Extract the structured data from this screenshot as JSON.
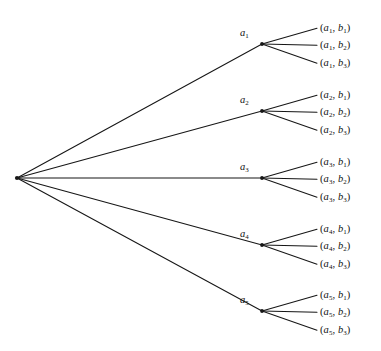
{
  "figure": {
    "kind": "tree-diagram",
    "title": "",
    "background_color": "#ffffff",
    "line_color": "#161616",
    "text_color": "#111111"
  },
  "root": {
    "label": "",
    "x": 17,
    "y": 178
  },
  "branches": [
    {
      "id": "a1",
      "label_main": "a",
      "label_sub": "1",
      "node_x": 262,
      "node_y": 44,
      "label_x": 240,
      "label_y": 28,
      "leaves": [
        {
          "open": "(",
          "first_main": "a",
          "first_sub": "1",
          "comma": ", ",
          "second_main": "b",
          "second_sub": "1",
          "close": ")",
          "x": 320,
          "y": 23
        },
        {
          "open": "(",
          "first_main": "a",
          "first_sub": "1",
          "comma": ", ",
          "second_main": "b",
          "second_sub": "2",
          "close": ")",
          "x": 320,
          "y": 40
        },
        {
          "open": "(",
          "first_main": "a",
          "first_sub": "1",
          "comma": ", ",
          "second_main": "b",
          "second_sub": "3",
          "close": ")",
          "x": 320,
          "y": 58
        }
      ]
    },
    {
      "id": "a2",
      "label_main": "a",
      "label_sub": "2",
      "node_x": 262,
      "node_y": 111,
      "label_x": 240,
      "label_y": 95,
      "leaves": [
        {
          "open": "(",
          "first_main": "a",
          "first_sub": "2",
          "comma": ", ",
          "second_main": "b",
          "second_sub": "1",
          "close": ")",
          "x": 320,
          "y": 90
        },
        {
          "open": "(",
          "first_main": "a",
          "first_sub": "2",
          "comma": ", ",
          "second_main": "b",
          "second_sub": "2",
          "close": ")",
          "x": 320,
          "y": 107
        },
        {
          "open": "(",
          "first_main": "a",
          "first_sub": "2",
          "comma": ", ",
          "second_main": "b",
          "second_sub": "3",
          "close": ")",
          "x": 320,
          "y": 125
        }
      ]
    },
    {
      "id": "a3",
      "label_main": "a",
      "label_sub": "3",
      "node_x": 262,
      "node_y": 178,
      "label_x": 240,
      "label_y": 162,
      "leaves": [
        {
          "open": "(",
          "first_main": "a",
          "first_sub": "3",
          "comma": ", ",
          "second_main": "b",
          "second_sub": "1",
          "close": ")",
          "x": 320,
          "y": 157
        },
        {
          "open": "(",
          "first_main": "a",
          "first_sub": "3",
          "comma": ", ",
          "second_main": "b",
          "second_sub": "2",
          "close": ")",
          "x": 320,
          "y": 174
        },
        {
          "open": "(",
          "first_main": "a",
          "first_sub": "3",
          "comma": ", ",
          "second_main": "b",
          "second_sub": "3",
          "close": ")",
          "x": 320,
          "y": 192
        }
      ]
    },
    {
      "id": "a4",
      "label_main": "a",
      "label_sub": "4",
      "node_x": 262,
      "node_y": 245,
      "label_x": 240,
      "label_y": 229,
      "leaves": [
        {
          "open": "(",
          "first_main": "a",
          "first_sub": "4",
          "comma": ", ",
          "second_main": "b",
          "second_sub": "1",
          "close": ")",
          "x": 320,
          "y": 224
        },
        {
          "open": "(",
          "first_main": "a",
          "first_sub": "4",
          "comma": ", ",
          "second_main": "b",
          "second_sub": "2",
          "close": ")",
          "x": 320,
          "y": 241
        },
        {
          "open": "(",
          "first_main": "a",
          "first_sub": "4",
          "comma": ", ",
          "second_main": "b",
          "second_sub": "3",
          "close": ")",
          "x": 320,
          "y": 259
        }
      ]
    },
    {
      "id": "a5",
      "label_main": "a",
      "label_sub": "5",
      "node_x": 262,
      "node_y": 311,
      "label_x": 240,
      "label_y": 295,
      "leaves": [
        {
          "open": "(",
          "first_main": "a",
          "first_sub": "5",
          "comma": ", ",
          "second_main": "b",
          "second_sub": "1",
          "close": ")",
          "x": 320,
          "y": 290
        },
        {
          "open": "(",
          "first_main": "a",
          "first_sub": "5",
          "comma": ", ",
          "second_main": "b",
          "second_sub": "2",
          "close": ")",
          "x": 320,
          "y": 307
        },
        {
          "open": "(",
          "first_main": "a",
          "first_sub": "5",
          "comma": ", ",
          "second_main": "b",
          "second_sub": "3",
          "close": ")",
          "x": 320,
          "y": 325
        }
      ]
    }
  ],
  "geometry": {
    "leaf_line_end_x": 317,
    "leaf_line_start_x": 264,
    "node_dot_radius": 1.9,
    "root_dot_radius": 2.1
  }
}
